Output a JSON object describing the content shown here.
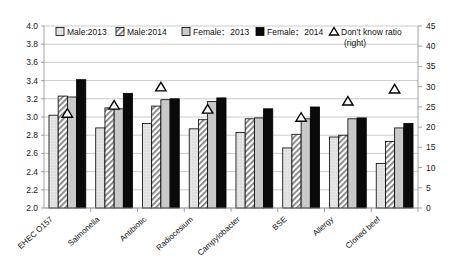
{
  "chart_data": {
    "type": "bar",
    "title": "",
    "subtitle": "",
    "xlabel": "",
    "ylabel": "",
    "y2label": "",
    "categories": [
      "EHEC O157",
      "Salmonella",
      "Antibiotic",
      "Radiocesium",
      "Campylobacter",
      "BSE",
      "Allergy",
      "Cloned beef"
    ],
    "ylim": [
      2.0,
      4.0
    ],
    "y2lim": [
      0,
      45
    ],
    "yticks": [
      "2.0",
      "2.2",
      "2.4",
      "2.6",
      "2.8",
      "3.0",
      "3.2",
      "3.4",
      "3.6",
      "3.8",
      "4.0"
    ],
    "y2ticks": [
      "0",
      "5",
      "10",
      "15",
      "20",
      "25",
      "30",
      "35",
      "40",
      "45"
    ],
    "grid": true,
    "legend_position": "top",
    "series": [
      {
        "name": "Male:2013",
        "axis": "left",
        "pattern": "light-dotted",
        "values": [
          3.02,
          2.88,
          2.93,
          2.87,
          2.83,
          2.66,
          2.78,
          2.49
        ]
      },
      {
        "name": "Male:2014",
        "axis": "left",
        "pattern": "diagonal-hatch",
        "values": [
          3.23,
          3.1,
          3.12,
          2.97,
          2.98,
          2.81,
          2.8,
          2.73
        ]
      },
      {
        "name": "Female：2013",
        "axis": "left",
        "pattern": "solid-gray",
        "values": [
          3.22,
          3.09,
          3.19,
          3.17,
          2.99,
          2.98,
          2.98,
          2.88
        ]
      },
      {
        "name": "Female：2014",
        "axis": "left",
        "pattern": "solid-black",
        "values": [
          3.41,
          3.26,
          3.2,
          3.21,
          3.09,
          3.11,
          2.99,
          2.93
        ]
      },
      {
        "name": "Don't know ratio (right)",
        "axis": "right",
        "marker": "triangle",
        "values": [
          23.5,
          25.5,
          30.0,
          24.5,
          0.0,
          22.5,
          26.5,
          29.5
        ]
      }
    ],
    "legend": [
      {
        "label": "Male:2013",
        "swatch": "light-dotted"
      },
      {
        "label": "Male:2014",
        "swatch": "diagonal-hatch"
      },
      {
        "label": "Female：2013",
        "swatch": "solid-gray"
      },
      {
        "label": "Female：2014",
        "swatch": "solid-black"
      },
      {
        "label": "Don't know ratio",
        "label2": "(right)",
        "swatch": "triangle"
      }
    ]
  }
}
